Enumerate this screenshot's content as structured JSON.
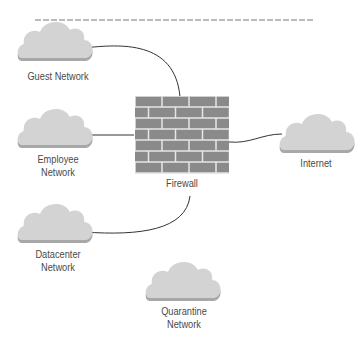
{
  "colors": {
    "cloud_fill": "#d3d3d3",
    "cloud_shadow": "#a8a8a8",
    "brick": "#8a8a8a",
    "mortar": "#e6e6e6",
    "line": "#333333",
    "label": "#4a4a4a"
  },
  "nodes": {
    "guest": {
      "label": "Guest Network",
      "icon": "cloud-icon"
    },
    "employee": {
      "label": "Employee\nNetwork",
      "icon": "cloud-icon"
    },
    "datacenter": {
      "label": "Datacenter\nNetwork",
      "icon": "cloud-icon"
    },
    "quarantine": {
      "label": "Quarantine\nNetwork",
      "icon": "cloud-icon"
    },
    "internet": {
      "label": "Internet",
      "icon": "cloud-icon"
    },
    "firewall": {
      "label": "Firewall",
      "icon": "brick-wall-icon"
    }
  },
  "connections": [
    {
      "from": "Guest Network",
      "to": "Firewall"
    },
    {
      "from": "Employee Network",
      "to": "Firewall"
    },
    {
      "from": "Datacenter Network",
      "to": "Firewall"
    },
    {
      "from": "Firewall",
      "to": "Internet"
    }
  ]
}
